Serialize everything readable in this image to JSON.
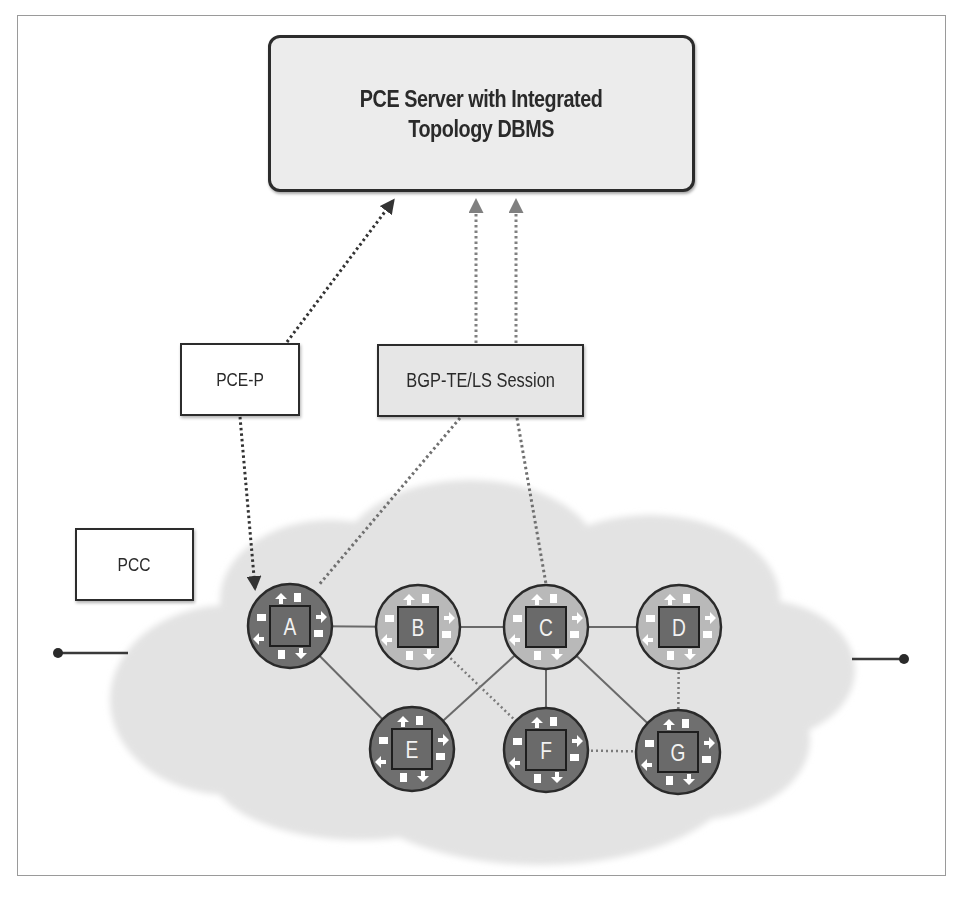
{
  "diagram": {
    "title": "PCE Server with Integrated Topology DBMS",
    "boxes": {
      "server": {
        "line1": "PCE Server with Integrated",
        "line2": "Topology DBMS"
      },
      "pcep": {
        "label": "PCE-P"
      },
      "bgp": {
        "label": "BGP-TE/LS Session"
      },
      "pcc": {
        "label": "PCC"
      }
    },
    "nodes": [
      {
        "id": "A",
        "label": "A",
        "x": 290,
        "y": 626,
        "shade": "dark"
      },
      {
        "id": "B",
        "label": "B",
        "x": 418,
        "y": 627,
        "shade": "light"
      },
      {
        "id": "C",
        "label": "C",
        "x": 546,
        "y": 627,
        "shade": "light"
      },
      {
        "id": "D",
        "label": "D",
        "x": 679,
        "y": 627,
        "shade": "light"
      },
      {
        "id": "E",
        "label": "E",
        "x": 412,
        "y": 749,
        "shade": "dark"
      },
      {
        "id": "F",
        "label": "F",
        "x": 546,
        "y": 750,
        "shade": "dark"
      },
      {
        "id": "G",
        "label": "G",
        "x": 678,
        "y": 752,
        "shade": "dark"
      }
    ],
    "links": [
      {
        "from": "A",
        "to": "B",
        "style": "solid"
      },
      {
        "from": "B",
        "to": "C",
        "style": "solid"
      },
      {
        "from": "C",
        "to": "D",
        "style": "solid"
      },
      {
        "from": "A",
        "to": "E",
        "style": "solid"
      },
      {
        "from": "E",
        "to": "C",
        "style": "solid"
      },
      {
        "from": "C",
        "to": "F",
        "style": "solid"
      },
      {
        "from": "C",
        "to": "G",
        "style": "solid"
      },
      {
        "from": "B",
        "to": "F",
        "style": "dotted"
      },
      {
        "from": "F",
        "to": "G",
        "style": "dotted"
      },
      {
        "from": "D",
        "to": "G",
        "style": "dotted"
      }
    ],
    "sessions": [
      {
        "name": "pcep-to-server",
        "x1": 287,
        "y1": 342,
        "x2": 393,
        "y2": 201,
        "color": "#333333",
        "arrow": true
      },
      {
        "name": "pcep-to-node-a",
        "x1": 240,
        "y1": 417,
        "x2": 255,
        "y2": 588,
        "color": "#333333",
        "arrow": true
      },
      {
        "name": "bgp-to-server-1",
        "x1": 476,
        "y1": 343,
        "x2": 476,
        "y2": 201,
        "color": "#808080",
        "arrow": true
      },
      {
        "name": "bgp-to-server-2",
        "x1": 516,
        "y1": 343,
        "x2": 516,
        "y2": 201,
        "color": "#808080",
        "arrow": true
      },
      {
        "name": "bgp-to-node-a",
        "x1": 460,
        "y1": 418,
        "x2": 318,
        "y2": 586,
        "color": "#707070",
        "arrow": false
      },
      {
        "name": "bgp-to-node-c",
        "x1": 517,
        "y1": 418,
        "x2": 546,
        "y2": 584,
        "color": "#707070",
        "arrow": false
      }
    ],
    "endpoints": [
      {
        "name": "left-endpoint",
        "dot_x": 58,
        "dot_y": 653,
        "line_to_x": 128
      },
      {
        "name": "right-endpoint",
        "dot_x": 904,
        "dot_y": 659,
        "line_to_x": 852
      }
    ],
    "colors": {
      "cloud": "#e3e3e3",
      "node_dark": "#6f6f6f",
      "node_light": "#b9b9b9",
      "node_square": "#6a6a6a",
      "outline": "#2a2a2a",
      "link": "#6a6a6a"
    }
  }
}
